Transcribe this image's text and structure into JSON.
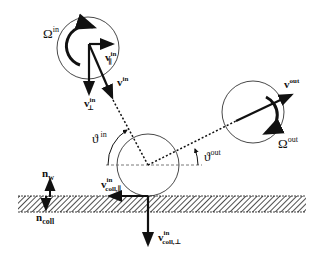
{
  "figure": {
    "type": "particle-wall collision schematic",
    "colors": {
      "ink": "#111111",
      "background": "#ffffff",
      "hatch": "#222222"
    },
    "labels": {
      "omega_in": {
        "base": "Ω",
        "sup": "in"
      },
      "v_par_in": {
        "base": "v",
        "sup": "in",
        "sub": "∥"
      },
      "v_perp_in": {
        "base": "v",
        "sup": "in",
        "sub": "⊥"
      },
      "v_in": {
        "base": "v",
        "sup": "in"
      },
      "v_out": {
        "base": "v",
        "sup": "out"
      },
      "omega_out": {
        "base": "Ω",
        "sup": "out"
      },
      "theta_in": {
        "base": "ϑ",
        "sup": "in"
      },
      "theta_out": {
        "base": "ϑ",
        "sup": "out"
      },
      "n_w": {
        "base": "n",
        "sub": "w"
      },
      "n_coll": {
        "base": "n",
        "sub": "coll"
      },
      "v_coll_par_in": {
        "base": "v",
        "sup": "in",
        "sub": "coll,∥"
      },
      "v_coll_perp_in": {
        "base": "v",
        "sup": "in",
        "sub": "coll,⊥"
      }
    }
  }
}
